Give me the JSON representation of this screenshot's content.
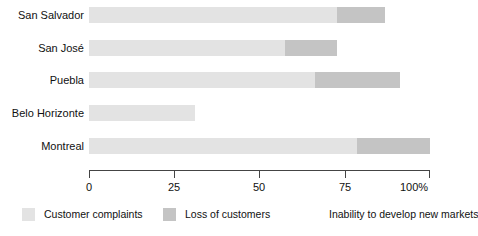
{
  "chart_data": {
    "type": "bar",
    "orientation": "horizontal",
    "stacked": true,
    "title": "",
    "subtitle": "",
    "xlabel": "",
    "ylabel": "",
    "xlim": [
      0,
      100
    ],
    "grid": false,
    "legend_position": "bottom",
    "categories": [
      "San Salvador",
      "San José",
      "Puebla",
      "Belo Horizonte",
      "Montreal"
    ],
    "tick_labels": [
      "0",
      "25",
      "50",
      "75",
      "100%"
    ],
    "tick_values": [
      0,
      25,
      50,
      75,
      100
    ],
    "series": [
      {
        "name": "Customer complaints",
        "color": "#e3e3e3",
        "values": [
          72.7,
          57.5,
          66.3,
          31.0,
          78.6
        ]
      },
      {
        "name": "Loss of customers",
        "color": "#c4c4c4",
        "values": [
          14.1,
          15.2,
          24.9,
          0.0,
          21.4
        ]
      },
      {
        "name": "Inability to develop new markets",
        "color": "#ffffff",
        "values": [
          0.0,
          0.0,
          0.0,
          0.0,
          0.0
        ]
      }
    ]
  },
  "axis": {
    "ticks": [
      {
        "label": "0",
        "value": 0
      },
      {
        "label": "25",
        "value": 25
      },
      {
        "label": "50",
        "value": 50
      },
      {
        "label": "75",
        "value": 75
      },
      {
        "label": "100%",
        "value": 100
      }
    ]
  },
  "legend": {
    "items": [
      {
        "label": "Customer complaints",
        "color": "#e3e3e3",
        "has_swatch": true
      },
      {
        "label": "Loss of customers",
        "color": "#c4c4c4",
        "has_swatch": true
      },
      {
        "label": "Inability to develop new markets",
        "color": "#ffffff",
        "has_swatch": false
      }
    ]
  },
  "rows": [
    {
      "label": "San Salvador",
      "a": 72.7,
      "b": 14.1,
      "c": 0.0
    },
    {
      "label": "San José",
      "a": 57.5,
      "b": 15.2,
      "c": 0.0
    },
    {
      "label": "Puebla",
      "a": 66.3,
      "b": 24.9,
      "c": 0.0
    },
    {
      "label": "Belo Horizonte",
      "a": 31.0,
      "b": 0.0,
      "c": 0.0
    },
    {
      "label": "Montreal",
      "a": 78.6,
      "b": 21.4,
      "c": 0.0
    }
  ]
}
